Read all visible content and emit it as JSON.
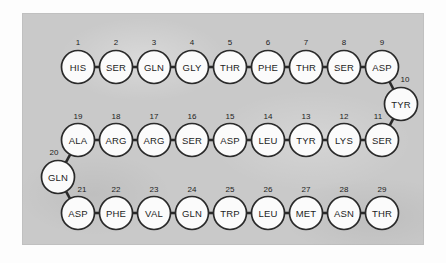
{
  "figure": {
    "panel_background_color": "#c9c9c9",
    "page_background_color": "#fdfdfd",
    "circle_fill_color": "#fbfbfb",
    "line_color": "#2a2a2a",
    "text_color": "#1d1d1d"
  },
  "chain": {
    "residue_count": 29,
    "residues": [
      {
        "index": "1",
        "code": "HIS",
        "cx": 78,
        "cy": 67,
        "num_x": 78,
        "num_y": 45
      },
      {
        "index": "2",
        "code": "SER",
        "cx": 116,
        "cy": 67,
        "num_x": 116,
        "num_y": 45
      },
      {
        "index": "3",
        "code": "GLN",
        "cx": 154,
        "cy": 67,
        "num_x": 154,
        "num_y": 45
      },
      {
        "index": "4",
        "code": "GLY",
        "cx": 192,
        "cy": 67,
        "num_x": 192,
        "num_y": 45
      },
      {
        "index": "5",
        "code": "THR",
        "cx": 230,
        "cy": 67,
        "num_x": 230,
        "num_y": 45
      },
      {
        "index": "6",
        "code": "PHE",
        "cx": 268,
        "cy": 67,
        "num_x": 268,
        "num_y": 45
      },
      {
        "index": "7",
        "code": "THR",
        "cx": 306,
        "cy": 67,
        "num_x": 306,
        "num_y": 45
      },
      {
        "index": "8",
        "code": "SER",
        "cx": 344,
        "cy": 67,
        "num_x": 344,
        "num_y": 45
      },
      {
        "index": "9",
        "code": "ASP",
        "cx": 382,
        "cy": 67,
        "num_x": 382,
        "num_y": 45
      },
      {
        "index": "10",
        "code": "TYR",
        "cx": 401,
        "cy": 104,
        "num_x": 405,
        "num_y": 82
      },
      {
        "index": "11",
        "code": "SER",
        "cx": 382,
        "cy": 140,
        "num_x": 378,
        "num_y": 119
      },
      {
        "index": "12",
        "code": "LYS",
        "cx": 344,
        "cy": 140,
        "num_x": 344,
        "num_y": 119
      },
      {
        "index": "13",
        "code": "TYR",
        "cx": 306,
        "cy": 140,
        "num_x": 306,
        "num_y": 119
      },
      {
        "index": "14",
        "code": "LEU",
        "cx": 268,
        "cy": 140,
        "num_x": 268,
        "num_y": 119
      },
      {
        "index": "15",
        "code": "ASP",
        "cx": 230,
        "cy": 140,
        "num_x": 230,
        "num_y": 119
      },
      {
        "index": "16",
        "code": "SER",
        "cx": 192,
        "cy": 140,
        "num_x": 192,
        "num_y": 119
      },
      {
        "index": "17",
        "code": "ARG",
        "cx": 154,
        "cy": 140,
        "num_x": 154,
        "num_y": 119
      },
      {
        "index": "18",
        "code": "ARG",
        "cx": 116,
        "cy": 140,
        "num_x": 116,
        "num_y": 119
      },
      {
        "index": "19",
        "code": "ALA",
        "cx": 78,
        "cy": 140,
        "num_x": 78,
        "num_y": 119
      },
      {
        "index": "20",
        "code": "GLN",
        "cx": 58,
        "cy": 177,
        "num_x": 54,
        "num_y": 155
      },
      {
        "index": "21",
        "code": "ASP",
        "cx": 78,
        "cy": 213,
        "num_x": 82,
        "num_y": 192
      },
      {
        "index": "22",
        "code": "PHE",
        "cx": 116,
        "cy": 213,
        "num_x": 116,
        "num_y": 192
      },
      {
        "index": "23",
        "code": "VAL",
        "cx": 154,
        "cy": 213,
        "num_x": 154,
        "num_y": 192
      },
      {
        "index": "24",
        "code": "GLN",
        "cx": 192,
        "cy": 213,
        "num_x": 192,
        "num_y": 192
      },
      {
        "index": "25",
        "code": "TRP",
        "cx": 230,
        "cy": 213,
        "num_x": 230,
        "num_y": 192
      },
      {
        "index": "26",
        "code": "LEU",
        "cx": 268,
        "cy": 213,
        "num_x": 268,
        "num_y": 192
      },
      {
        "index": "27",
        "code": "MET",
        "cx": 306,
        "cy": 213,
        "num_x": 306,
        "num_y": 192
      },
      {
        "index": "28",
        "code": "ASN",
        "cx": 344,
        "cy": 213,
        "num_x": 344,
        "num_y": 192
      },
      {
        "index": "29",
        "code": "THR",
        "cx": 382,
        "cy": 213,
        "num_x": 382,
        "num_y": 192
      }
    ],
    "circle_radius": 16.5
  }
}
